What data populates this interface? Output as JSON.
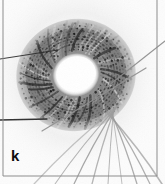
{
  "figure": {
    "panel_label": "k",
    "image_kind": "electron-micrograph",
    "background_color": "#fcfcfc",
    "border_color": "#8d8d8d",
    "width_px": 165,
    "height_px": 184,
    "borders": {
      "left_rule": true,
      "right_rule": true,
      "bottom_rule": true,
      "top_rule": false,
      "left_rule_x": 3,
      "right_rule_x": 157,
      "bottom_rule_y": 176
    },
    "specimen": {
      "name": "toroidal-filament-bundle",
      "description": "Dark ring-shaped bundle of coiled filaments with a bright elliptical central hole, with individual filaments splaying out toward the lower right.",
      "ring": {
        "center_x": 76,
        "center_y": 75,
        "outer_radius_x": 64,
        "outer_radius_y": 60,
        "inner_radius_x": 23,
        "inner_radius_y": 21,
        "rotation_deg": -12,
        "dark_tone": "#2e2e2e",
        "mid_tone": "#777777",
        "light_tone": "#c8c8c8",
        "hole_tone": "#fdfdfd",
        "striation_count": 46
      },
      "splayed_filaments": {
        "count": 9,
        "origin_x": 120,
        "origin_y": 104,
        "tone": "#9a9a9a",
        "stroke_width": 1.1
      },
      "overlay_lines": [
        {
          "name": "left-upper-fiber",
          "x1": 0,
          "y1": 59,
          "x2": 58,
          "y2": 50,
          "tone": "#2b2b2b",
          "width": 1.2
        },
        {
          "name": "left-lower-fiber",
          "x1": 0,
          "y1": 120,
          "x2": 47,
          "y2": 119,
          "tone": "#1f1f1f",
          "width": 1.3
        },
        {
          "name": "upper-right-fiber",
          "x1": 108,
          "y1": 86,
          "x2": 165,
          "y2": 41,
          "tone": "#8a8a8a",
          "width": 1.1
        },
        {
          "name": "diagonal-cross-fiber",
          "x1": 42,
          "y1": 131,
          "x2": 146,
          "y2": 68,
          "tone": "#8f8f8f",
          "width": 1.2
        }
      ]
    }
  }
}
